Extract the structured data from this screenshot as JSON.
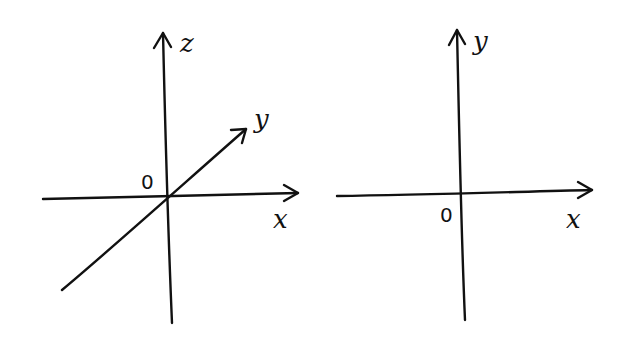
{
  "diagrams": [
    {
      "name": "3d-coordinate-system",
      "axes": {
        "z": "z",
        "y": "y",
        "x": "x"
      },
      "origin": "0"
    },
    {
      "name": "2d-coordinate-system",
      "axes": {
        "y": "y",
        "x": "x"
      },
      "origin": "0"
    }
  ],
  "colors": {
    "ink": "#111111",
    "background": "#ffffff"
  }
}
